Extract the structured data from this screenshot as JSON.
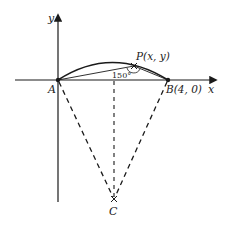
{
  "diagram": {
    "axes": {
      "x_label": "x",
      "y_label": "y"
    },
    "points": {
      "A": {
        "label": "A"
      },
      "B": {
        "label": "B(4, 0)"
      },
      "P": {
        "label": "P(x, y)"
      },
      "C": {
        "label": "C"
      }
    },
    "angle": {
      "label": "150°",
      "vertex": "P"
    },
    "colors": {
      "stroke": "#1a1a1a",
      "background": "#ffffff"
    }
  }
}
